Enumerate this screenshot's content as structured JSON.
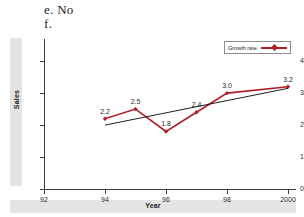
{
  "answer": {
    "line_e": "e. No",
    "line_f": "f."
  },
  "legend": {
    "label": "Growth rate",
    "position": "top-right",
    "series_color": "#b01f28"
  },
  "chart_data": {
    "type": "line",
    "title": "",
    "xlabel": "Year",
    "ylabel": "Sales",
    "grid": false,
    "legend_position": "top-right",
    "xlim": [
      92,
      2000
    ],
    "ylim": [
      0,
      4.6
    ],
    "x_tick_labels": [
      "92",
      "94",
      "96",
      "98",
      "2000"
    ],
    "x_tick_values": [
      92,
      94,
      96,
      98,
      2000
    ],
    "y_tick_labels": [
      "0",
      "1",
      "2",
      "3",
      "4"
    ],
    "y_tick_values": [
      0,
      1,
      2,
      3,
      4
    ],
    "series": [
      {
        "name": "Growth rate",
        "color": "#b01f28",
        "marker": "diamond",
        "x": [
          94,
          95,
          96,
          97,
          98,
          2000
        ],
        "values": [
          2.2,
          2.5,
          1.8,
          2.4,
          3.0,
          3.2
        ],
        "data_labels": [
          "2.2",
          "2.5",
          "1.8",
          "2.4",
          "3.0",
          "3.2"
        ]
      },
      {
        "name": "Trend line",
        "color": "#1f1f1f",
        "marker": "none",
        "x": [
          94,
          2000
        ],
        "values": [
          2.0,
          3.15
        ],
        "data_labels": []
      }
    ]
  }
}
